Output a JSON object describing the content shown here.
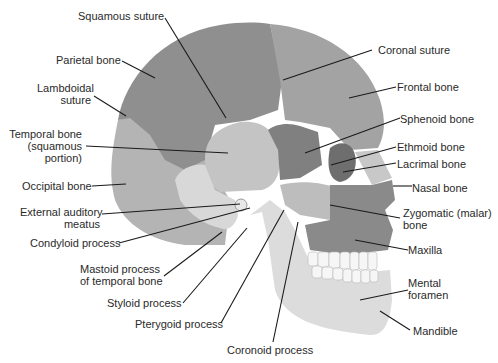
{
  "diagram": {
    "colors": {
      "background": "#ffffff",
      "parietal": "#8f8f8f",
      "frontal": "#a3a3a3",
      "occipital": "#b4b4b4",
      "temporal_squamous": "#c4c4c4",
      "temporal_lower": "#d8d8d8",
      "sphenoid": "#808080",
      "ethmoid_lacrimal": "#6e6e6e",
      "zygomatic": "#bdbdbd",
      "maxilla": "#8a8a8a",
      "mandible": "#dcdcdc",
      "nasal": "#c8c8c8",
      "teeth": "#f6f6f6",
      "leader_line": "#1a1a1a",
      "text": "#2a2a2a"
    },
    "labels": {
      "squamous_suture": "Squamous suture",
      "parietal_bone": "Parietal bone",
      "lambdoidal_suture_1": "Lambdoidal",
      "lambdoidal_suture_2": "suture",
      "temporal_bone_1": "Temporal bone",
      "temporal_bone_2": "(squamous",
      "temporal_bone_3": "portion)",
      "occipital_bone": "Occipital bone",
      "external_auditory_1": "External auditory",
      "external_auditory_2": "meatus",
      "condyloid_process": "Condyloid process",
      "mastoid_process_1": "Mastoid process",
      "mastoid_process_2": "of temporal bone",
      "styloid_process": "Styloid process",
      "pterygoid_process": "Pterygoid process",
      "coronoid_process": "Coronoid process",
      "coronal_suture": "Coronal suture",
      "frontal_bone": "Frontal bone",
      "sphenoid_bone": "Sphenoid bone",
      "ethmoid_bone": "Ethmoid bone",
      "lacrimal_bone": "Lacrimal bone",
      "nasal_bone": "Nasal bone",
      "zygomatic_bone_1": "Zygomatic (malar)",
      "zygomatic_bone_2": "bone",
      "maxilla": "Maxilla",
      "mental_foramen_1": "Mental",
      "mental_foramen_2": "foramen",
      "mandible": "Mandible"
    }
  }
}
